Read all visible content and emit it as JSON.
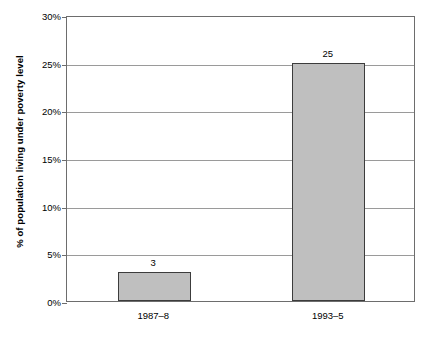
{
  "chart_data": {
    "type": "bar",
    "title": "",
    "subtitle": "",
    "xlabel": "",
    "ylabel": "% of population living under poverty level",
    "categories": [
      "1987–8",
      "1993–5"
    ],
    "values": [
      3,
      25
    ],
    "value_labels": [
      "3",
      "25"
    ],
    "ylim": [
      0,
      30
    ],
    "y_ticks": [
      0,
      5,
      10,
      15,
      20,
      25,
      30
    ],
    "y_tick_labels": [
      "0%",
      "5%",
      "10%",
      "15%",
      "20%",
      "25%",
      "30%"
    ],
    "grid": true,
    "grid_axis": "y",
    "legend": false,
    "legend_position": "none",
    "bar_fill_color": "#bfbfbf",
    "bar_border_color": "#3c3c3c",
    "grid_color": "#9a9a9a",
    "axis_color": "#6d6d6d",
    "background_color": "#ffffff",
    "text_color": "#000000"
  }
}
